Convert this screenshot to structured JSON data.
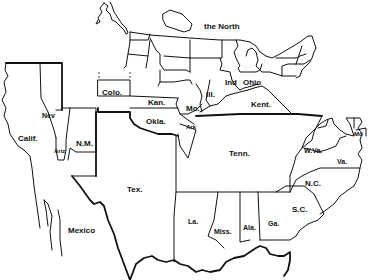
{
  "map": {
    "style": "black-and-white outline map",
    "colors": {
      "line": "#111111",
      "background": "#ffffff"
    },
    "region_labels": {
      "north": "the North",
      "mexico": "Mexico"
    },
    "state_labels": {
      "colo": "Colo.",
      "nev": "Nev",
      "calif": "Calif.",
      "ariz": "Ariz",
      "nm": "N.M.",
      "kan": "Kan.",
      "okla": "Okla.",
      "mo": "Mo.",
      "ark": "Ark",
      "ill": "Ill.",
      "ind": "Ind",
      "ohio": "Ohio",
      "kent": "Kent.",
      "tex": "Tex.",
      "tenn": "Tenn.",
      "wva": "W.Va.",
      "va": "Va.",
      "md": "Md",
      "nc": "N.C.",
      "sc": "S.C.",
      "la": "La.",
      "miss": "Miss.",
      "ala": "Ala.",
      "ga": "Ga."
    }
  }
}
